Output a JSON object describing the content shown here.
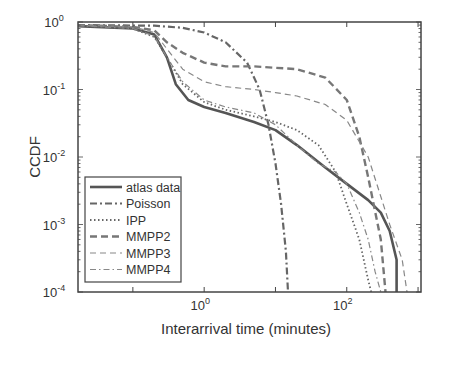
{
  "chart_data": {
    "type": "line",
    "title": "",
    "xlabel": "Interarrival time (minutes)",
    "ylabel": "CCDF",
    "xscale": "log",
    "yscale": "log",
    "xlim": [
      0.017,
      1100
    ],
    "ylim": [
      0.0001,
      1
    ],
    "xticks": [
      {
        "label": "10",
        "exp": "0",
        "value": 1
      },
      {
        "label": "10",
        "exp": "2",
        "value": 100
      }
    ],
    "yticks": [
      {
        "label": "10",
        "exp": "0",
        "value": 1
      },
      {
        "label": "10",
        "exp": "-1",
        "value": 0.1
      },
      {
        "label": "10",
        "exp": "-2",
        "value": 0.01
      },
      {
        "label": "10",
        "exp": "-3",
        "value": 0.001
      },
      {
        "label": "10",
        "exp": "-4",
        "value": 0.0001
      }
    ],
    "grid": false,
    "legend_position": "lower left",
    "series": [
      {
        "name": "atlas data",
        "style": "solid",
        "width": 2.6,
        "color": "#555555",
        "x": [
          0.017,
          0.1,
          0.2,
          0.3,
          0.4,
          0.6,
          1,
          2,
          5,
          10,
          20,
          50,
          100,
          200,
          300,
          400,
          500,
          500
        ],
        "y": [
          0.87,
          0.8,
          0.65,
          0.3,
          0.12,
          0.07,
          0.055,
          0.045,
          0.033,
          0.025,
          0.015,
          0.007,
          0.004,
          0.0023,
          0.0015,
          0.0008,
          0.0003,
          0.0001
        ]
      },
      {
        "name": "Poisson",
        "style": "dashdot",
        "width": 2.2,
        "color": "#666666",
        "x": [
          0.017,
          0.2,
          0.5,
          1,
          2,
          4,
          6,
          8,
          10,
          12,
          14,
          15
        ],
        "y": [
          0.9,
          0.88,
          0.82,
          0.7,
          0.5,
          0.25,
          0.1,
          0.03,
          0.008,
          0.002,
          0.0004,
          0.0001
        ]
      },
      {
        "name": "IPP",
        "style": "dotted",
        "width": 1.8,
        "color": "#666666",
        "x": [
          0.017,
          0.1,
          0.2,
          0.3,
          0.5,
          1,
          2,
          5,
          10,
          20,
          40,
          70,
          100,
          150,
          200,
          220
        ],
        "y": [
          0.88,
          0.8,
          0.6,
          0.3,
          0.12,
          0.065,
          0.05,
          0.04,
          0.033,
          0.025,
          0.015,
          0.006,
          0.002,
          0.0006,
          0.00015,
          0.0001
        ]
      },
      {
        "name": "MMPP2",
        "style": "dashed",
        "width": 2.4,
        "color": "#777777",
        "x": [
          0.017,
          0.1,
          0.2,
          0.3,
          0.5,
          1,
          2,
          5,
          10,
          20,
          50,
          100,
          150,
          200,
          300,
          350
        ],
        "y": [
          0.9,
          0.85,
          0.75,
          0.5,
          0.35,
          0.25,
          0.22,
          0.22,
          0.21,
          0.2,
          0.15,
          0.07,
          0.02,
          0.005,
          0.0006,
          0.0001
        ]
      },
      {
        "name": "MMPP3",
        "style": "dashed-thin",
        "width": 1.2,
        "color": "#888888",
        "x": [
          0.017,
          0.1,
          0.2,
          0.3,
          0.5,
          1,
          2,
          5,
          10,
          20,
          50,
          100,
          200,
          400,
          600,
          700
        ],
        "y": [
          0.9,
          0.85,
          0.7,
          0.4,
          0.2,
          0.13,
          0.11,
          0.1,
          0.09,
          0.08,
          0.06,
          0.035,
          0.01,
          0.001,
          0.0003,
          0.0001
        ]
      },
      {
        "name": "MMPP4",
        "style": "dashdot-thin",
        "width": 1.2,
        "color": "#888888",
        "x": [
          0.017,
          0.1,
          0.2,
          0.3,
          0.5,
          1,
          2,
          5,
          10,
          20,
          40,
          70,
          100,
          150,
          200,
          250,
          300
        ],
        "y": [
          0.88,
          0.8,
          0.62,
          0.3,
          0.13,
          0.07,
          0.055,
          0.045,
          0.03,
          0.015,
          0.008,
          0.006,
          0.004,
          0.0015,
          0.0006,
          0.0002,
          0.0001
        ]
      }
    ]
  }
}
